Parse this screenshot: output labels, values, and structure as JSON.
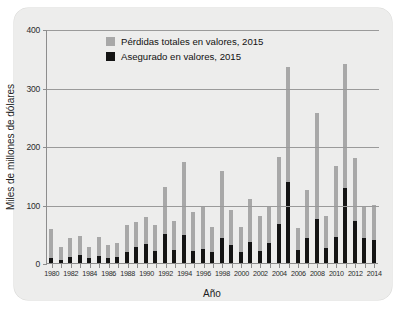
{
  "chart_data": {
    "type": "bar",
    "title": "",
    "subtitle": "",
    "xlabel": "Año",
    "ylabel": "Miles de millones de dólares",
    "ylim": [
      0,
      400
    ],
    "yticks": [
      0,
      100,
      200,
      300,
      400
    ],
    "ytick_labels": [
      "0",
      "100",
      "200",
      "300",
      "400"
    ],
    "grid": true,
    "legend_position": "top-left-inside",
    "categories": [
      "1980",
      "1981",
      "1982",
      "1983",
      "1984",
      "1985",
      "1986",
      "1987",
      "1988",
      "1989",
      "1990",
      "1991",
      "1992",
      "1993",
      "1994",
      "1995",
      "1996",
      "1997",
      "1998",
      "1999",
      "2000",
      "2001",
      "2002",
      "2003",
      "2004",
      "2005",
      "2006",
      "2007",
      "2008",
      "2009",
      "2010",
      "2011",
      "2012",
      "2013",
      "2014"
    ],
    "xtick_labels": [
      "1980",
      "1982",
      "1984",
      "1986",
      "1988",
      "1990",
      "1992",
      "1994",
      "1996",
      "1998",
      "2000",
      "2002",
      "2004",
      "2006",
      "2008",
      "2010",
      "2012",
      "2014"
    ],
    "series": [
      {
        "name": "Pérdidas totales en valores, 2015",
        "color": "#a8a8a8",
        "values": [
          58,
          28,
          42,
          46,
          28,
          45,
          30,
          34,
          65,
          70,
          78,
          65,
          130,
          72,
          172,
          88,
          98,
          62,
          157,
          90,
          62,
          110,
          80,
          98,
          182,
          335,
          60,
          125,
          257,
          80,
          165,
          340,
          180,
          95,
          100
        ]
      },
      {
        "name": "Asegurado en valores, 2015",
        "color": "#141414",
        "values": [
          8,
          6,
          10,
          14,
          8,
          12,
          9,
          10,
          18,
          28,
          32,
          20,
          50,
          22,
          48,
          20,
          24,
          18,
          42,
          30,
          18,
          36,
          20,
          34,
          66,
          138,
          22,
          42,
          76,
          26,
          44,
          128,
          72,
          42,
          40
        ]
      }
    ],
    "legend": [
      {
        "label": "Pérdidas totales en valores, 2015",
        "swatch": "total-swatch"
      },
      {
        "label": "Asegurado en valores, 2015",
        "swatch": "insured-swatch"
      }
    ]
  }
}
